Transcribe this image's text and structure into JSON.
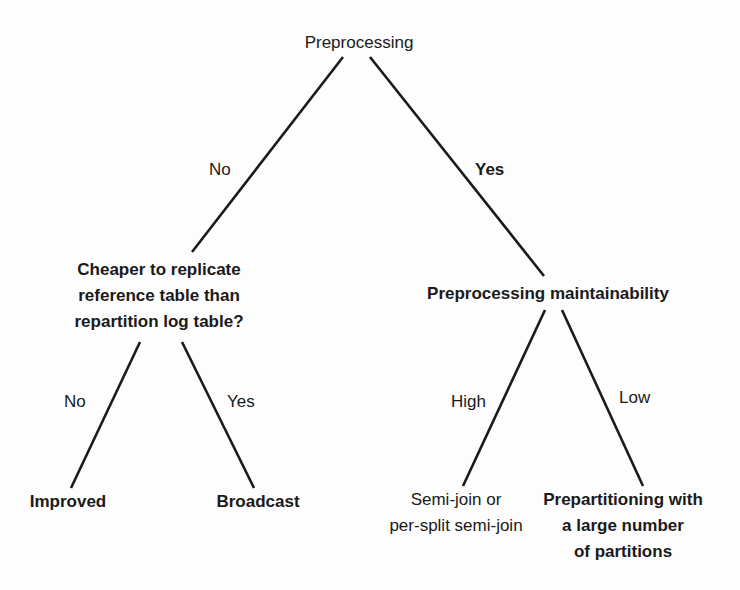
{
  "diagram": {
    "type": "decision-tree",
    "background": "#fdfdfd",
    "line_color": "#1a1a1a",
    "nodes": {
      "root": {
        "label": "Preprocessing"
      },
      "cheaper": {
        "lines": [
          "Cheaper to replicate",
          "reference table than",
          "repartition log table?"
        ]
      },
      "maintainability": {
        "label": "Preprocessing maintainability"
      },
      "improved": {
        "label": "Improved"
      },
      "broadcast": {
        "label": "Broadcast"
      },
      "semijoin": {
        "lines": [
          "Semi-join or",
          "per-split semi-join"
        ]
      },
      "prepartitioning": {
        "lines": [
          "Prepartitioning with",
          "a large number",
          "of partitions"
        ]
      }
    },
    "edges": [
      {
        "from": "root",
        "to": "cheaper",
        "label": "No"
      },
      {
        "from": "root",
        "to": "maintainability",
        "label": "Yes"
      },
      {
        "from": "cheaper",
        "to": "improved",
        "label": "No"
      },
      {
        "from": "cheaper",
        "to": "broadcast",
        "label": "Yes"
      },
      {
        "from": "maintainability",
        "to": "semijoin",
        "label": "High"
      },
      {
        "from": "maintainability",
        "to": "prepartitioning",
        "label": "Low"
      }
    ]
  }
}
